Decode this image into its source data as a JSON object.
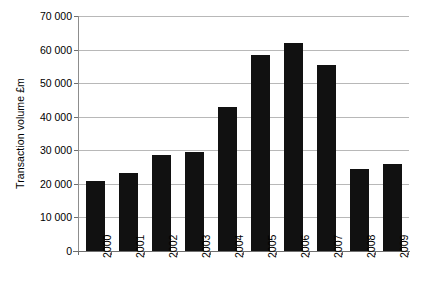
{
  "chart_data": {
    "type": "bar",
    "title": "",
    "subtitle": "",
    "xlabel": "",
    "ylabel": "Transaction volume £m",
    "categories": [
      "2000",
      "2001",
      "2002",
      "2003",
      "2004",
      "2005",
      "2006",
      "2007",
      "2008",
      "2009"
    ],
    "values": [
      21000,
      23300,
      28500,
      29500,
      43000,
      58500,
      62000,
      55500,
      24500,
      25800
    ],
    "series": [
      {
        "name": "Transaction volume",
        "values": [
          21000,
          23300,
          28500,
          29500,
          43000,
          58500,
          62000,
          55500,
          24500,
          25800
        ]
      }
    ],
    "ylim": [
      0,
      70000
    ],
    "ytick_values": [
      0,
      10000,
      20000,
      30000,
      40000,
      50000,
      60000,
      70000
    ],
    "ytick_labels": [
      "0",
      "10 000",
      "20 000",
      "30 000",
      "40 000",
      "50 000",
      "60 000",
      "70 000"
    ],
    "grid": true,
    "grid_axis": "y",
    "legend": false,
    "legend_position": "none",
    "bar_color": "#111111",
    "gridline_color": "#b8b8b8",
    "axis_color": "#6f6f6f",
    "background_color": "#ffffff",
    "xtick_label_rotation": 90
  }
}
